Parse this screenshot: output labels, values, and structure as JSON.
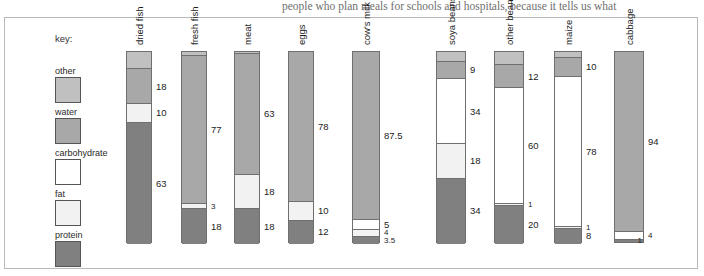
{
  "page": {
    "surrounding_text": "people who plan meals for schools and hospitals, because it tells us what"
  },
  "legend": {
    "title": "key:",
    "items": [
      {
        "label": "other",
        "color": "#c0c0c0"
      },
      {
        "label": "water",
        "color": "#a8a8a8"
      },
      {
        "label": "carbohydrate",
        "color": "#ffffff"
      },
      {
        "label": "fat",
        "color": "#f2f2f2"
      },
      {
        "label": "protein",
        "color": "#808080"
      }
    ]
  },
  "chart_data": {
    "type": "bar",
    "subtype": "stacked-bar",
    "title": "",
    "xlabel": "",
    "ylabel": "",
    "ylim": [
      0,
      100
    ],
    "grid": false,
    "legend_position": "left",
    "units": "percent",
    "categories": [
      "dried fish",
      "fresh fish",
      "meat",
      "eggs",
      "cow's milk",
      "soya beans",
      "other beans",
      "maize",
      "cabbage"
    ],
    "components": [
      "other",
      "water",
      "carbohydrate",
      "fat",
      "protein"
    ],
    "component_colors": {
      "other": "#c0c0c0",
      "water": "#a8a8a8",
      "carbohydrate": "#ffffff",
      "fat": "#f2f2f2",
      "protein": "#808080"
    },
    "series": [
      {
        "name": "other",
        "values": [
          9,
          2,
          1,
          0,
          0,
          5,
          7,
          3,
          1
        ]
      },
      {
        "name": "water",
        "values": [
          18,
          77,
          63,
          78,
          87.5,
          9,
          12,
          10,
          94
        ]
      },
      {
        "name": "carbohydrate",
        "values": [
          0,
          0,
          0,
          0,
          5,
          34,
          60,
          78,
          4
        ]
      },
      {
        "name": "fat",
        "values": [
          10,
          3,
          18,
          10,
          4,
          18,
          1,
          1,
          0
        ]
      },
      {
        "name": "protein",
        "values": [
          63,
          18,
          18,
          12,
          3.5,
          34,
          20,
          8,
          1
        ]
      }
    ],
    "columns": [
      {
        "label": "dried fish",
        "total": 100,
        "segments": [
          {
            "component": "other",
            "value": 9,
            "label": "",
            "show": false
          },
          {
            "component": "water",
            "value": 18,
            "label": "18",
            "show": true
          },
          {
            "component": "fat",
            "value": 10,
            "label": "10",
            "show": true
          },
          {
            "component": "protein",
            "value": 63,
            "label": "63",
            "show": true
          }
        ]
      },
      {
        "label": "fresh fish",
        "total": 100,
        "segments": [
          {
            "component": "other",
            "value": 2,
            "label": "",
            "show": false
          },
          {
            "component": "water",
            "value": 77,
            "label": "77",
            "show": true
          },
          {
            "component": "fat",
            "value": 3,
            "label": "3",
            "show": true
          },
          {
            "component": "protein",
            "value": 18,
            "label": "18",
            "show": true
          }
        ]
      },
      {
        "label": "meat",
        "total": 100,
        "segments": [
          {
            "component": "other",
            "value": 1,
            "label": "",
            "show": false
          },
          {
            "component": "water",
            "value": 63,
            "label": "63",
            "show": true
          },
          {
            "component": "fat",
            "value": 18,
            "label": "18",
            "show": true
          },
          {
            "component": "protein",
            "value": 18,
            "label": "18",
            "show": true
          }
        ]
      },
      {
        "label": "eggs",
        "total": 100,
        "segments": [
          {
            "component": "water",
            "value": 78,
            "label": "78",
            "show": true
          },
          {
            "component": "fat",
            "value": 10,
            "label": "10",
            "show": true
          },
          {
            "component": "protein",
            "value": 12,
            "label": "12",
            "show": true
          }
        ]
      },
      {
        "label": "cow's milk",
        "total": 100,
        "segments": [
          {
            "component": "water",
            "value": 87.5,
            "label": "87.5",
            "show": true
          },
          {
            "component": "carbohydrate",
            "value": 5,
            "label": "5",
            "show": true
          },
          {
            "component": "fat",
            "value": 4,
            "label": "4",
            "show": true
          },
          {
            "component": "protein",
            "value": 3.5,
            "label": "3.5",
            "show": true
          }
        ]
      },
      {
        "label": "soya beans",
        "total": 100,
        "segments": [
          {
            "component": "other",
            "value": 5,
            "label": "",
            "show": false
          },
          {
            "component": "water",
            "value": 9,
            "label": "9",
            "show": true
          },
          {
            "component": "carbohydrate",
            "value": 34,
            "label": "34",
            "show": true
          },
          {
            "component": "fat",
            "value": 18,
            "label": "18",
            "show": true
          },
          {
            "component": "protein",
            "value": 34,
            "label": "34",
            "show": true
          }
        ]
      },
      {
        "label": "other beans",
        "total": 100,
        "segments": [
          {
            "component": "other",
            "value": 7,
            "label": "",
            "show": false
          },
          {
            "component": "water",
            "value": 12,
            "label": "12",
            "show": true
          },
          {
            "component": "carbohydrate",
            "value": 60,
            "label": "60",
            "show": true
          },
          {
            "component": "fat",
            "value": 1,
            "label": "1",
            "show": true
          },
          {
            "component": "protein",
            "value": 20,
            "label": "20",
            "show": true
          }
        ]
      },
      {
        "label": "maize",
        "total": 100,
        "segments": [
          {
            "component": "other",
            "value": 3,
            "label": "",
            "show": false
          },
          {
            "component": "water",
            "value": 10,
            "label": "10",
            "show": true
          },
          {
            "component": "carbohydrate",
            "value": 78,
            "label": "78",
            "show": true
          },
          {
            "component": "fat",
            "value": 1,
            "label": "1",
            "show": true
          },
          {
            "component": "protein",
            "value": 8,
            "label": "8",
            "show": true
          }
        ]
      },
      {
        "label": "cabbage",
        "total": 100,
        "segments": [
          {
            "component": "water",
            "value": 94,
            "label": "94",
            "show": true
          },
          {
            "component": "carbohydrate",
            "value": 4,
            "label": "4",
            "show": true
          },
          {
            "component": "protein",
            "value": 1,
            "label": "1",
            "show": true,
            "side": "left"
          }
        ]
      }
    ]
  }
}
